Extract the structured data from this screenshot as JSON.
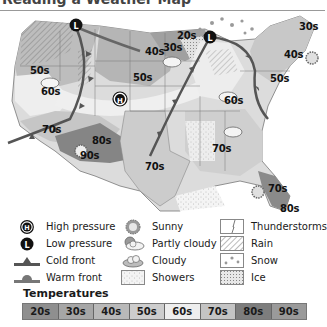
{
  "title": "Reading a Weather Map",
  "map": {
    "temperature_labels": [
      {
        "text": "50s",
        "x": 30,
        "y": 65
      },
      {
        "text": "60s",
        "x": 40,
        "y": 86
      },
      {
        "text": "70s",
        "x": 42,
        "y": 124
      },
      {
        "text": "80s",
        "x": 92,
        "y": 135
      },
      {
        "text": "90s",
        "x": 80,
        "y": 150
      },
      {
        "text": "40s",
        "x": 145,
        "y": 46
      },
      {
        "text": "50s",
        "x": 133,
        "y": 72
      },
      {
        "text": "20s",
        "x": 178,
        "y": 30
      },
      {
        "text": "30s",
        "x": 163,
        "y": 42
      },
      {
        "text": "60s",
        "x": 224,
        "y": 95
      },
      {
        "text": "30s",
        "x": 299,
        "y": 20
      },
      {
        "text": "40s",
        "x": 284,
        "y": 49
      },
      {
        "text": "50s",
        "x": 270,
        "y": 73
      },
      {
        "text": "70s",
        "x": 145,
        "y": 160
      },
      {
        "text": "70s",
        "x": 212,
        "y": 143
      },
      {
        "text": "70s",
        "x": 268,
        "y": 182
      },
      {
        "text": "80s",
        "x": 280,
        "y": 202
      }
    ],
    "pressure_systems": [
      {
        "type": "high",
        "symbol": "H",
        "x": 120,
        "y": 88
      },
      {
        "type": "low",
        "symbol": "L",
        "x": 76,
        "y": 14
      },
      {
        "type": "low",
        "symbol": "L",
        "x": 210,
        "y": 26
      }
    ]
  },
  "legend": {
    "items": [
      {
        "icon": "high-pressure-icon",
        "label": "High pressure"
      },
      {
        "icon": "low-pressure-icon",
        "label": "Low pressure"
      },
      {
        "icon": "cold-front-icon",
        "label": "Cold front"
      },
      {
        "icon": "warm-front-icon",
        "label": "Warm front"
      },
      {
        "icon": "sunny-icon",
        "label": "Sunny"
      },
      {
        "icon": "partly-cloudy-icon",
        "label": "Partly cloudy"
      },
      {
        "icon": "cloudy-icon",
        "label": "Cloudy"
      },
      {
        "icon": "showers-icon",
        "label": "Showers"
      },
      {
        "icon": "thunderstorms-icon",
        "label": "Thunderstorms"
      },
      {
        "icon": "rain-icon",
        "label": "Rain"
      },
      {
        "icon": "snow-icon",
        "label": "Snow"
      },
      {
        "icon": "ice-icon",
        "label": "Ice"
      }
    ]
  },
  "temperatures": {
    "title": "Temperatures",
    "bands": [
      {
        "label": "20s",
        "color": "#8f8f8f"
      },
      {
        "label": "30s",
        "color": "#a6a6a6"
      },
      {
        "label": "40s",
        "color": "#b9b9b9"
      },
      {
        "label": "50s",
        "color": "#cdcdcd"
      },
      {
        "label": "60s",
        "color": "#eeeeee"
      },
      {
        "label": "70s",
        "color": "#c4c4c4"
      },
      {
        "label": "80s",
        "color": "#7d7d7d"
      },
      {
        "label": "90s",
        "color": "#9a9a9a"
      }
    ]
  }
}
